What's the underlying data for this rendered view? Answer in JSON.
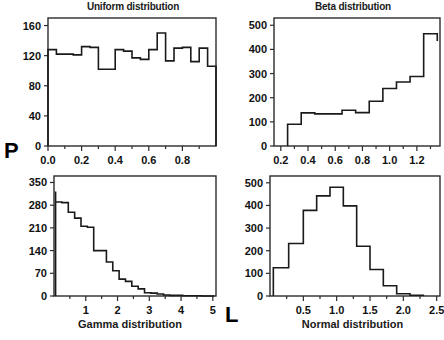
{
  "figure": {
    "width": 444,
    "height": 340,
    "background": "#ffffff",
    "line_color": "#1a1a1a",
    "axis_label_left": "P",
    "axis_label_bottom": "L"
  },
  "panels": {
    "uniform": {
      "title": "Uniform distribution"
    },
    "beta": {
      "title": "Beta distribution"
    },
    "gamma": {
      "title": "Gamma distribution"
    },
    "normal": {
      "title": "Normal distribution"
    }
  },
  "chart_data": [
    {
      "type": "bar",
      "id": "uniform",
      "title": "Uniform distribution",
      "xlabel": "",
      "ylabel": "",
      "xlim": [
        0.0,
        1.0
      ],
      "ylim": [
        0,
        170
      ],
      "xticks": [
        0.0,
        0.2,
        0.4,
        0.6,
        0.8
      ],
      "xticklabels": [
        "0.0",
        "0.2",
        "0.4",
        "0.6",
        "0.8"
      ],
      "xminorticks": [
        0.1,
        0.3,
        0.5,
        0.7,
        0.9
      ],
      "yticks": [
        0,
        40,
        80,
        120,
        160
      ],
      "yticklabels": [
        "0",
        "40",
        "80",
        "120",
        "160"
      ],
      "grid": false,
      "legend": "none",
      "bin_edges": [
        0.0,
        0.05,
        0.1,
        0.15,
        0.2,
        0.25,
        0.3,
        0.35,
        0.4,
        0.45,
        0.5,
        0.55,
        0.6,
        0.65,
        0.7,
        0.75,
        0.8,
        0.85,
        0.9,
        0.95,
        1.0
      ],
      "values": [
        128,
        122,
        122,
        121,
        132,
        131,
        102,
        102,
        128,
        126,
        117,
        115,
        128,
        150,
        113,
        130,
        131,
        112,
        130,
        106
      ]
    },
    {
      "type": "bar",
      "id": "beta",
      "title": "Beta distribution",
      "xlabel": "",
      "ylabel": "",
      "xlim": [
        0.15,
        1.37
      ],
      "ylim": [
        0,
        530
      ],
      "xticks": [
        0.2,
        0.4,
        0.6,
        0.8,
        1.0,
        1.2
      ],
      "xticklabels": [
        "0.2",
        "0.4",
        "0.6",
        "0.8",
        "1.0",
        "1.2"
      ],
      "xminorticks": [
        0.3,
        0.5,
        0.7,
        0.9,
        1.1,
        1.3
      ],
      "yticks": [
        0,
        100,
        200,
        300,
        400,
        500
      ],
      "yticklabels": [
        "0",
        "100",
        "200",
        "300",
        "400",
        "500"
      ],
      "grid": false,
      "legend": "none",
      "bin_edges": [
        0.25,
        0.35,
        0.45,
        0.55,
        0.65,
        0.75,
        0.85,
        0.95,
        1.05,
        1.15,
        1.25,
        1.35
      ],
      "values": [
        90,
        137,
        133,
        133,
        148,
        138,
        185,
        238,
        265,
        288,
        465,
        435
      ]
    },
    {
      "type": "bar",
      "id": "gamma",
      "title": "Gamma distribution",
      "xlabel": "Gamma distribution",
      "ylabel": "",
      "xlim": [
        0.0,
        5.1
      ],
      "ylim": [
        0,
        370
      ],
      "xticks": [
        1,
        2,
        3,
        4,
        5
      ],
      "xticklabels": [
        "1",
        "2",
        "3",
        "4",
        "5"
      ],
      "xminorticks": [
        0.5,
        1.5,
        2.5,
        3.5,
        4.5
      ],
      "yticks": [
        0,
        70,
        140,
        210,
        280,
        350
      ],
      "yticklabels": [
        "0",
        "70",
        "140",
        "210",
        "280",
        "350"
      ],
      "grid": false,
      "legend": "none",
      "bin_edges": [
        0.05,
        0.25,
        0.45,
        0.65,
        0.85,
        1.05,
        1.25,
        1.45,
        1.65,
        1.85,
        2.05,
        2.25,
        2.45,
        2.65,
        2.85,
        3.05,
        3.25,
        3.45,
        3.65,
        3.85,
        4.05,
        4.25,
        4.45,
        4.65,
        5.05
      ],
      "values": [
        290,
        288,
        258,
        240,
        215,
        212,
        140,
        140,
        105,
        78,
        52,
        45,
        30,
        22,
        10,
        9,
        6,
        3,
        2,
        2,
        1,
        1,
        1,
        0
      ],
      "first_edge_peak": 322
    },
    {
      "type": "bar",
      "id": "normal",
      "title": "Normal distribution",
      "xlabel": "Normal distribution",
      "ylabel": "",
      "xlim": [
        0.0,
        2.55
      ],
      "ylim": [
        0,
        530
      ],
      "xticks": [
        0.5,
        1.0,
        1.5,
        2.0,
        2.5
      ],
      "xticklabels": [
        "0.5",
        "1.0",
        "1.5",
        "2.0",
        "2.5"
      ],
      "xminorticks": [
        0.25,
        0.75,
        1.25,
        1.75,
        2.25
      ],
      "yticks": [
        0,
        100,
        200,
        300,
        400,
        500
      ],
      "yticklabels": [
        "0",
        "100",
        "200",
        "300",
        "400",
        "500"
      ],
      "grid": false,
      "legend": "none",
      "bin_edges": [
        0.05,
        0.28,
        0.5,
        0.7,
        0.9,
        1.1,
        1.3,
        1.5,
        1.7,
        1.9,
        2.1,
        2.3
      ],
      "values": [
        125,
        232,
        378,
        442,
        480,
        398,
        220,
        117,
        45,
        10,
        3
      ]
    }
  ]
}
